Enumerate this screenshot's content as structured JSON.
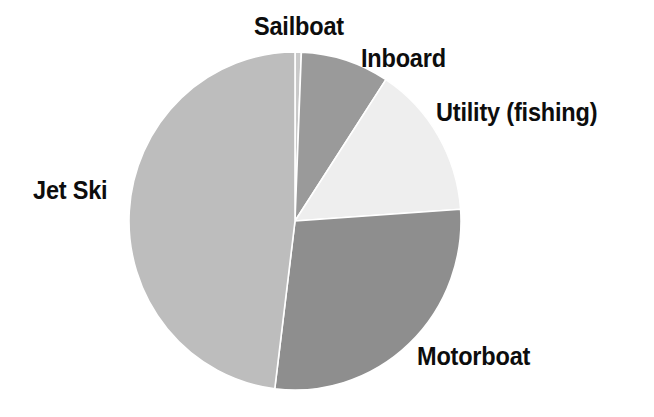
{
  "chart_data": {
    "type": "pie",
    "title": "",
    "subtitle": "",
    "xlabel": "",
    "ylabel": "",
    "legend_position": "none",
    "grid": false,
    "labels_placement": "outside-callout",
    "categories": [
      "Sailboat",
      "Inboard",
      "Utility (fishing)",
      "Motorboat",
      "Jet Ski"
    ],
    "values": [
      0.6,
      8.6,
      14.7,
      28.1,
      48.0
    ],
    "units": "percent",
    "slices": [
      {
        "label": "Sailboat",
        "value": 0.6,
        "start_angle_deg": 0.0,
        "end_angle_deg": 2.2,
        "color": "#c9c9c9"
      },
      {
        "label": "Inboard",
        "value": 8.6,
        "start_angle_deg": 2.2,
        "end_angle_deg": 33.2,
        "color": "#9a9a9a"
      },
      {
        "label": "Utility (fishing)",
        "value": 14.7,
        "start_angle_deg": 33.2,
        "end_angle_deg": 86.0,
        "color": "#eeeeee"
      },
      {
        "label": "Motorboat",
        "value": 28.1,
        "start_angle_deg": 86.0,
        "end_angle_deg": 187.0,
        "color": "#8e8e8e"
      },
      {
        "label": "Jet Ski",
        "value": 48.0,
        "start_angle_deg": 187.0,
        "end_angle_deg": 360.0,
        "color": "#bdbdbd"
      }
    ],
    "geometry": {
      "center_x": 295,
      "center_y": 221,
      "radius_x": 166,
      "radius_y": 169,
      "stroke_color": "#ffffff",
      "stroke_width": 1.6
    }
  },
  "labels": {
    "sailboat": "Sailboat",
    "inboard": "Inboard",
    "utility": "Utility (fishing)",
    "jetski": "Jet Ski",
    "motorboat": "Motorboat"
  },
  "colors": {
    "background": "#ffffff",
    "text": "#0d0d0d",
    "sailboat": "#c9c9c9",
    "inboard": "#9a9a9a",
    "utility": "#eeeeee",
    "motorboat": "#8e8e8e",
    "jetski": "#bdbdbd"
  }
}
